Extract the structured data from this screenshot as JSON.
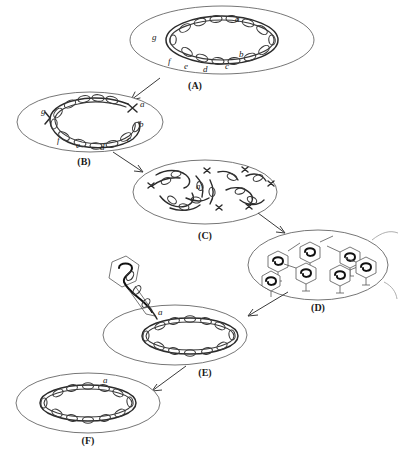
{
  "figure": {
    "domain_note": "bacterial genetics life-cycle diagram",
    "background_color": "#ffffff",
    "colors": {
      "cell_outline": "#666666",
      "chromosome": "#2b2b2b",
      "phage_outline": "#555555",
      "phage_dna": "#111111",
      "arrow": "#3a3a3a",
      "text": "#1a1a1a"
    }
  },
  "panels": [
    {
      "id": "A",
      "caption": "(A)",
      "description": "donor bacterial cell with intact circular chromosome",
      "loci": [
        "a",
        "b",
        "c",
        "d",
        "e",
        "f",
        "g"
      ]
    },
    {
      "id": "B",
      "caption": "(B)",
      "description": "circular chromosome broken open near locus a",
      "loci": [
        "a",
        "b",
        "c",
        "d",
        "e",
        "f",
        "g"
      ]
    },
    {
      "id": "C",
      "caption": "(C)",
      "description": "chromosome fragmented into many pieces, fragment a among them",
      "loci": [
        "a"
      ]
    },
    {
      "id": "D",
      "caption": "(D)",
      "description": "phage particles assembled, each hexagonal head packaging a DNA fragment",
      "loci": []
    },
    {
      "id": "E",
      "caption": "(E)",
      "description": "transducing phage injects donor fragment a into recipient cell",
      "loci": [
        "a"
      ]
    },
    {
      "id": "F",
      "caption": "(F)",
      "description": "recombinant recipient chromosome carrying locus a",
      "loci": [
        "a"
      ]
    }
  ],
  "arrows": [
    {
      "from": "A",
      "to": "B"
    },
    {
      "from": "B",
      "to": "C"
    },
    {
      "from": "C",
      "to": "D"
    },
    {
      "from": "D",
      "to": "E"
    },
    {
      "from": "E",
      "to": "F"
    }
  ]
}
